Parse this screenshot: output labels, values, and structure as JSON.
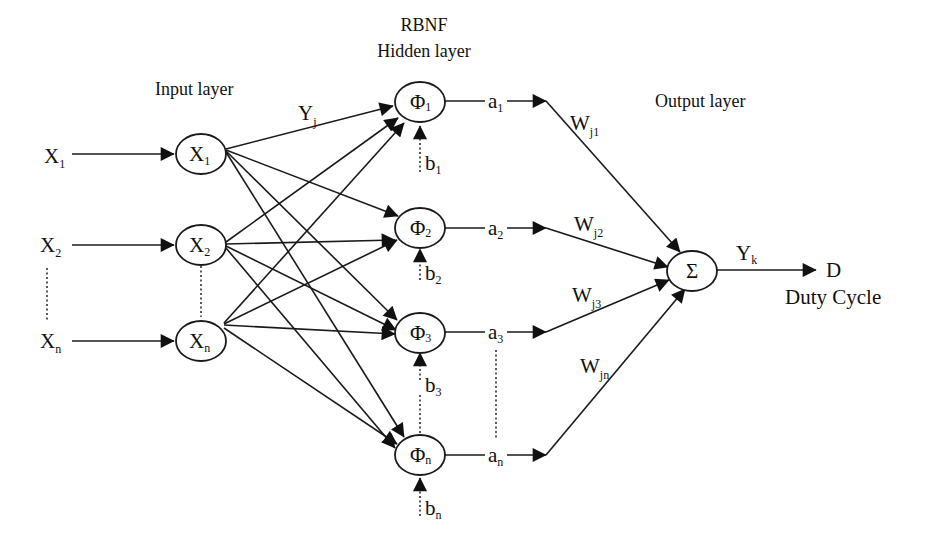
{
  "layers": {
    "input": "Input layer",
    "hidden_line1": "RBNF",
    "hidden_line2": "Hidden layer",
    "output": "Output layer"
  },
  "inputs": [
    {
      "base": "X",
      "sub": "1"
    },
    {
      "base": "X",
      "sub": "2"
    },
    {
      "base": "X",
      "sub": "n"
    }
  ],
  "input_nodes": [
    {
      "base": "X",
      "sub": "1"
    },
    {
      "base": "X",
      "sub": "2"
    },
    {
      "base": "X",
      "sub": "n"
    }
  ],
  "hidden_nodes": [
    {
      "base": "Φ",
      "sub": "1"
    },
    {
      "base": "Φ",
      "sub": "2"
    },
    {
      "base": "Φ",
      "sub": "3"
    },
    {
      "base": "Φ",
      "sub": "n"
    }
  ],
  "biases": [
    {
      "base": "b",
      "sub": "1"
    },
    {
      "base": "b",
      "sub": "2"
    },
    {
      "base": "b",
      "sub": "3"
    },
    {
      "base": "b",
      "sub": "n"
    }
  ],
  "activations": [
    {
      "base": "a",
      "sub": "1"
    },
    {
      "base": "a",
      "sub": "2"
    },
    {
      "base": "a",
      "sub": "3"
    },
    {
      "base": "a",
      "sub": "n"
    }
  ],
  "weights": [
    {
      "base": "W",
      "sub": "j1"
    },
    {
      "base": "W",
      "sub": "j2"
    },
    {
      "base": "W",
      "sub": "j3"
    },
    {
      "base": "W",
      "sub": "jn"
    }
  ],
  "hidden_input_label": {
    "base": "Y",
    "sub": "j"
  },
  "output_node": {
    "symbol": "Σ"
  },
  "output_signal": {
    "base": "Y",
    "sub": "k"
  },
  "output_target": "D",
  "output_caption": "Duty Cycle"
}
